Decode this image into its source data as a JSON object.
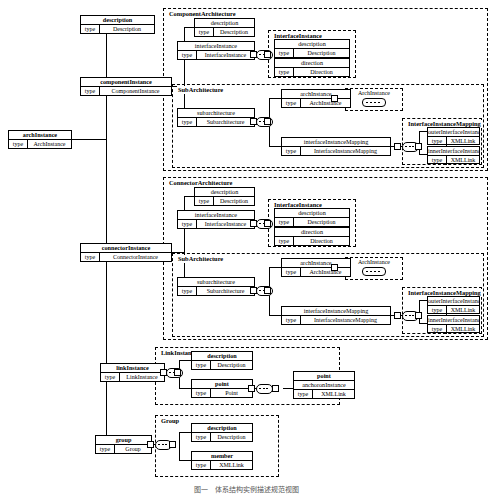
{
  "diagram": {
    "caption": "图一　体系结构实例描述规范视图",
    "type_key_label": "type"
  },
  "root": {
    "name": "archInstance",
    "type_key": "type",
    "type_value": "ArchInstance"
  },
  "top_level": [
    {
      "name": "description",
      "type_key": "type",
      "type_value": "Description"
    },
    {
      "name": "componentInstance",
      "type_key": "type",
      "type_value": "ComponentInstance"
    },
    {
      "name": "connectorInstance",
      "type_key": "type",
      "type_value": "ConnectorInstance"
    },
    {
      "name": "linkInstance",
      "type_key": "type",
      "type_value": "LinkInstance"
    },
    {
      "name": "group",
      "type_key": "type",
      "type_value": "Group"
    }
  ],
  "groups": {
    "component_architecture": {
      "label": "ComponentArchitecture"
    },
    "connector_architecture": {
      "label": "ConnectorArchitecture"
    },
    "interface_instance": {
      "label": "InterfaceInstance"
    },
    "sub_architecture": {
      "label": "SubArchitecture"
    },
    "mapping": {
      "label": "InterfaceInstanceMapping"
    },
    "link_instance": {
      "label": "LinkInstance"
    },
    "group_block": {
      "label": "Group"
    }
  },
  "component_architecture_fields": [
    {
      "name": "description",
      "type_key": "type",
      "type_value": "Description"
    },
    {
      "name": "interfaceInstance",
      "type_key": "type",
      "type_value": "InterfaceInstance"
    },
    {
      "name": "subarchitecture",
      "type_key": "type",
      "type_value": "Subarchitecture"
    }
  ],
  "connector_architecture_fields": [
    {
      "name": "description",
      "type_key": "type",
      "type_value": "Description"
    },
    {
      "name": "interfaceInstance",
      "type_key": "type",
      "type_value": "InterfaceInstance"
    },
    {
      "name": "subarchitecture",
      "type_key": "type",
      "type_value": "Subarchitecture"
    }
  ],
  "interface_instance_fields": [
    {
      "name": "description",
      "type_key": "type",
      "type_value": "Description"
    },
    {
      "name": "direction",
      "type_key": "type",
      "type_value": "Direction"
    }
  ],
  "sub_architecture_fields": [
    {
      "name": "archInstance",
      "type_key": "type",
      "type_value": "ArchInstance"
    },
    {
      "name": "interfaceInstanceMapping",
      "type_key": "type",
      "type_value": "InterfaceInstanceMapping"
    }
  ],
  "mapping_fields": [
    {
      "name": "outerInterfaceInstance",
      "type_key": "type",
      "type_value": "XMLLink"
    },
    {
      "name": "innerInterfaceInstance",
      "type_key": "type",
      "type_value": "XMLLink"
    }
  ],
  "recursion_stub": {
    "label": "ArchInstance"
  },
  "link_instance_fields": [
    {
      "name": "description",
      "type_key": "type",
      "type_value": "Description"
    },
    {
      "name": "point",
      "type_key": "type",
      "type_value": "Point"
    }
  ],
  "point_block": {
    "label": "point",
    "fields": [
      {
        "name": "anchoronInstance",
        "type_key": "type",
        "type_value": "XMLLink"
      }
    ]
  },
  "group_fields": [
    {
      "name": "description",
      "type_key": "type",
      "type_value": "Description"
    },
    {
      "name": "member",
      "type_key": "type",
      "type_value": "XMLLink"
    }
  ]
}
